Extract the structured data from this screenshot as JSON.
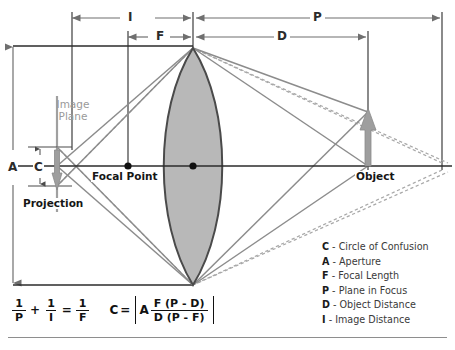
{
  "diagram": {
    "dimensions": [
      {
        "key": "I",
        "label": "I",
        "meaning": "Image Distance",
        "from_x": 72,
        "to_x": 193,
        "y": 18
      },
      {
        "key": "P",
        "label": "P",
        "meaning": "Plane in Focus",
        "from_x": 193,
        "to_x": 442,
        "y": 18
      },
      {
        "key": "F",
        "label": "F",
        "meaning": "Focal Length",
        "from_x": 128,
        "to_x": 193,
        "y": 37
      },
      {
        "key": "D",
        "label": "D",
        "meaning": "Object Distance",
        "from_x": 193,
        "to_x": 368,
        "y": 37
      }
    ],
    "aperture_dimension": {
      "label": "A",
      "meaning": "Aperture",
      "x": 13,
      "from_y": 45,
      "to_y": 285
    },
    "coc_dimension": {
      "label": "C",
      "meaning": "Circle of Confusion",
      "x": 40,
      "from_y": 147,
      "to_y": 186
    },
    "labels": {
      "image_plane_line1": "Image",
      "image_plane_line2": "Plane",
      "focal_point": "Focal Point",
      "projection": "Projection",
      "object": "Object"
    },
    "colors": {
      "lens_fill": "#b8b8b8",
      "lens_stroke": "#4a4a4a",
      "ray_solid": "#8c8c8c",
      "ray_dashed": "#a8a8a8",
      "axis": "#2b2b2b",
      "arrow_gray": "#9e9e9e",
      "plane_label": "#9a9a9a",
      "rule": "#8e8e8e"
    },
    "optical_axis_y": 166,
    "lens_center_x": 193
  },
  "legend": {
    "items": [
      {
        "key": "C",
        "separator": "-",
        "text": "Circle of Confusion"
      },
      {
        "key": "A",
        "separator": "-",
        "text": "Aperture"
      },
      {
        "key": "F",
        "separator": "-",
        "text": "Focal Length"
      },
      {
        "key": "P",
        "separator": "-",
        "text": "Plane in Focus"
      },
      {
        "key": "D",
        "separator": "-",
        "text": "Object Distance"
      },
      {
        "key": "I",
        "separator": "-",
        "text": "Image Distance"
      }
    ]
  },
  "formulas": {
    "thin_lens": {
      "expression": "1/P + 1/I = 1/F",
      "term1_num": "1",
      "term1_den": "P",
      "plus": "+",
      "term2_num": "1",
      "term2_den": "I",
      "equals": "=",
      "term3_num": "1",
      "term3_den": "F"
    },
    "circle_of_confusion": {
      "expression": "C = | A F(P-D) / D(P-F) |",
      "lhs": "C",
      "equals": "=",
      "factor": "A",
      "numerator": "F (P - D)",
      "denominator": "D (P - F)"
    }
  }
}
